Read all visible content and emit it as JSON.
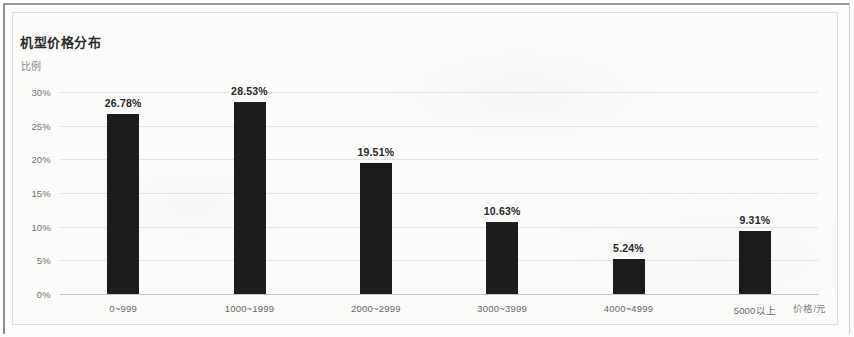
{
  "chart_data": {
    "type": "bar",
    "title": "机型价格分布",
    "xlabel": "价格/元",
    "ylabel": "比例",
    "categories": [
      "0~999",
      "1000~1999",
      "2000~2999",
      "3000~3999",
      "4000~4999",
      "5000以上"
    ],
    "values": [
      26.78,
      28.53,
      19.51,
      10.63,
      5.24,
      9.31
    ],
    "value_labels": [
      "26.78%",
      "28.53%",
      "19.51%",
      "10.63%",
      "5.24%",
      "9.31%"
    ],
    "ylim": [
      0,
      30
    ],
    "yticks": [
      0,
      5,
      10,
      15,
      20,
      25,
      30
    ],
    "ytick_labels": [
      "0%",
      "5%",
      "10%",
      "15%",
      "20%",
      "25%",
      "30%"
    ],
    "grid": true,
    "legend": "none",
    "bar_color": "#1c1c1c",
    "grid_color": "#e3e3e3",
    "axis_color": "#c4c4c4",
    "background_color": "#fcfcfb"
  }
}
